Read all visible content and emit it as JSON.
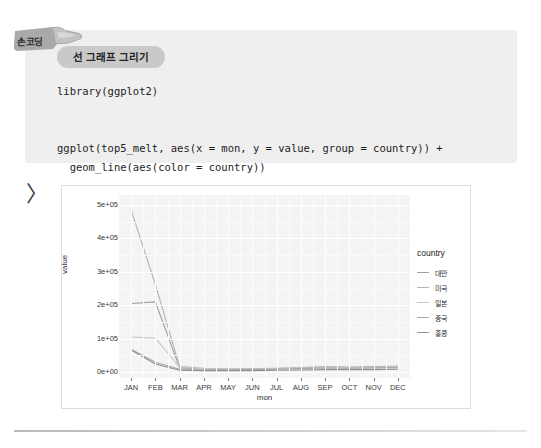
{
  "badge": {
    "label": "손코딩",
    "icon": "pointing-hand-icon"
  },
  "code_block": {
    "pill_label": "선 그래프 그리기",
    "lines": [
      "library(ggplot2)",
      "",
      "",
      "ggplot(top5_melt, aes(x = mon, y = value, group = country)) +",
      "  geom_line(aes(color = country))"
    ]
  },
  "console": {
    "prompt": "〉"
  },
  "chart_data": {
    "type": "line",
    "title": "",
    "xlabel": "mon",
    "ylabel": "value",
    "grid": true,
    "legend_position": "right",
    "legend_title": "country",
    "categories": [
      "JAN",
      "FEB",
      "MAR",
      "APR",
      "MAY",
      "JUN",
      "JUL",
      "AUG",
      "SEP",
      "OCT",
      "NOV",
      "DEC"
    ],
    "ytick_labels": [
      "0e+00",
      "1e+05",
      "2e+05",
      "3e+05",
      "4e+05",
      "5e+05"
    ],
    "ytick_values": [
      0,
      100000,
      200000,
      300000,
      400000,
      500000
    ],
    "ylim": [
      -18000,
      530000
    ],
    "series": [
      {
        "name": "대만",
        "color": "#9aa0a6",
        "values": [
          205000,
          210000,
          12000,
          9000,
          8000,
          9000,
          10000,
          12000,
          14000,
          13000,
          13000,
          14000
        ]
      },
      {
        "name": "미국",
        "color": "#b4b4b4",
        "values": [
          485000,
          262000,
          16000,
          11000,
          9000,
          10000,
          11000,
          13000,
          16000,
          15000,
          16000,
          18000
        ]
      },
      {
        "name": "일본",
        "color": "#c6c6c6",
        "values": [
          105000,
          101000,
          14000,
          10000,
          8000,
          9000,
          10000,
          12000,
          14000,
          13000,
          14000,
          15000
        ]
      },
      {
        "name": "중국",
        "color": "#a8a8a8",
        "values": [
          68000,
          29000,
          8000,
          6000,
          6000,
          7000,
          8000,
          10000,
          12000,
          11000,
          12000,
          13000
        ]
      },
      {
        "name": "홍콩",
        "color": "#8e8e8e",
        "values": [
          66000,
          24000,
          5000,
          4000,
          4000,
          4000,
          5000,
          6000,
          7000,
          7000,
          7000,
          8000
        ]
      }
    ]
  }
}
